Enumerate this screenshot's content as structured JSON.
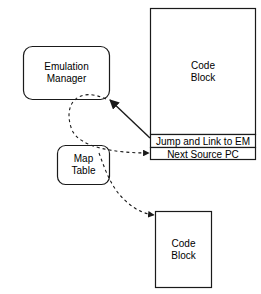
{
  "diagram": {
    "stroke_color": "#1a1a1a",
    "fill_color": "#ffffff",
    "text_color": "#000000",
    "nodes": {
      "emulation_manager": {
        "shape": "rounded-rectangle",
        "line1": "Emulation",
        "line2": "Manager"
      },
      "map_table": {
        "shape": "rounded-rectangle",
        "line1": "Map",
        "line2": "Table"
      },
      "code_block_top": {
        "shape": "rectangle",
        "line1": "Code",
        "line2": "Block",
        "rows": [
          {
            "label": "Jump and Link to EM"
          },
          {
            "label": "Next Source PC"
          }
        ]
      },
      "code_block_bottom": {
        "shape": "rectangle",
        "line1": "Code",
        "line2": "Block"
      }
    },
    "edges": [
      {
        "name": "jump-and-link-to-em-arrow",
        "style": "solid",
        "from": "code_block_top.jump_and_link_row",
        "to": "emulation_manager"
      },
      {
        "name": "next-source-pc-arrow",
        "style": "dashed",
        "from": "emulation_manager",
        "to": "code_block_top.next_source_pc_row"
      },
      {
        "name": "map-table-to-code-block-arrow",
        "style": "dashed",
        "from": "map_table",
        "to": "code_block_bottom"
      }
    ]
  }
}
